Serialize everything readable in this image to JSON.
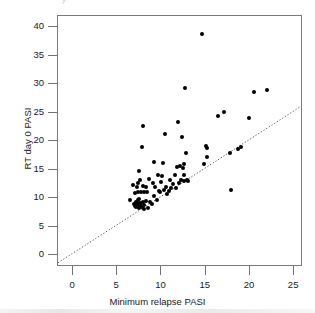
{
  "figure": {
    "scan_artifact_text": "y",
    "background_color": "#ffffff",
    "frame_color": "#777b7e",
    "point_color": "#000000",
    "reference_line_color": "#4d4d4d"
  },
  "chart_data": {
    "type": "scatter",
    "title": "",
    "xlabel": "Minimum relapse PASI",
    "ylabel": "RT day 0 PASI",
    "xlim": [
      -1.7,
      26.0
    ],
    "ylim": [
      -2.1,
      42.0
    ],
    "xticks": [
      0,
      5,
      10,
      15,
      20,
      25
    ],
    "yticks": [
      0,
      5,
      10,
      15,
      20,
      25,
      30,
      35,
      40
    ],
    "xticklabels": [
      "0",
      "5",
      "10",
      "15",
      "20",
      "25"
    ],
    "yticklabels": [
      "0",
      "5",
      "10",
      "15",
      "20",
      "25",
      "30",
      "35",
      "40"
    ],
    "grid": false,
    "legend": null,
    "marker": "filled-circle",
    "marker_size_px": 4,
    "annotations": [],
    "reference_line": {
      "label": "line of identity",
      "style": "dotted",
      "slope": 1.0,
      "intercept": 0.0,
      "x_start": -1.7,
      "x_end": 26.0,
      "y_start": -1.7,
      "y_end": 26.0
    },
    "points": [
      [
        6.4,
        9.6
      ],
      [
        6.8,
        12.3
      ],
      [
        6.9,
        9.0
      ],
      [
        7.0,
        8.7
      ],
      [
        7.0,
        10.9
      ],
      [
        7.1,
        9.3
      ],
      [
        7.1,
        8.4
      ],
      [
        7.2,
        11.9
      ],
      [
        7.2,
        9.1
      ],
      [
        7.25,
        8.6
      ],
      [
        7.3,
        12.6
      ],
      [
        7.3,
        9.6
      ],
      [
        7.35,
        8.9
      ],
      [
        7.4,
        11.0
      ],
      [
        7.4,
        9.4
      ],
      [
        7.45,
        8.3
      ],
      [
        7.5,
        14.7
      ],
      [
        7.5,
        9.8
      ],
      [
        7.55,
        9.0
      ],
      [
        7.6,
        13.1
      ],
      [
        7.6,
        8.6
      ],
      [
        7.7,
        11.1
      ],
      [
        7.7,
        9.2
      ],
      [
        7.8,
        19.0
      ],
      [
        7.8,
        8.5
      ],
      [
        7.9,
        22.6
      ],
      [
        7.9,
        12.2
      ],
      [
        7.95,
        9.4
      ],
      [
        8.0,
        11.0
      ],
      [
        8.0,
        8.8
      ],
      [
        8.05,
        8.1
      ],
      [
        8.2,
        12.0
      ],
      [
        8.3,
        9.5
      ],
      [
        8.4,
        11.0
      ],
      [
        8.5,
        8.2
      ],
      [
        8.6,
        13.4
      ],
      [
        8.7,
        9.3
      ],
      [
        8.9,
        9.0
      ],
      [
        9.0,
        12.7
      ],
      [
        9.1,
        10.3
      ],
      [
        9.2,
        16.4
      ],
      [
        9.3,
        11.9
      ],
      [
        9.5,
        9.6
      ],
      [
        9.6,
        14.1
      ],
      [
        9.7,
        11.3
      ],
      [
        9.8,
        11.0
      ],
      [
        10.0,
        12.9
      ],
      [
        10.1,
        13.9
      ],
      [
        10.2,
        16.2
      ],
      [
        10.3,
        11.5
      ],
      [
        10.4,
        21.3
      ],
      [
        10.5,
        12.0
      ],
      [
        10.6,
        10.8
      ],
      [
        10.8,
        11.2
      ],
      [
        11.0,
        13.1
      ],
      [
        11.1,
        11.8
      ],
      [
        11.3,
        12.4
      ],
      [
        11.5,
        14.0
      ],
      [
        11.6,
        11.7
      ],
      [
        11.8,
        15.4
      ],
      [
        11.9,
        23.4
      ],
      [
        12.0,
        12.6
      ],
      [
        12.1,
        15.7
      ],
      [
        12.2,
        13.2
      ],
      [
        12.3,
        20.7
      ],
      [
        12.4,
        15.3
      ],
      [
        12.5,
        16.0
      ],
      [
        12.5,
        14.0
      ],
      [
        12.6,
        13.0
      ],
      [
        12.7,
        29.3
      ],
      [
        12.8,
        17.9
      ],
      [
        12.9,
        13.1
      ],
      [
        13.0,
        13.0
      ],
      [
        14.6,
        38.8
      ],
      [
        14.8,
        16.0
      ],
      [
        15.0,
        19.2
      ],
      [
        15.1,
        18.8
      ],
      [
        15.2,
        17.3
      ],
      [
        16.4,
        24.4
      ],
      [
        17.1,
        25.2
      ],
      [
        17.7,
        17.9
      ],
      [
        17.9,
        11.5
      ],
      [
        18.6,
        18.7
      ],
      [
        19.0,
        18.9
      ],
      [
        19.9,
        24.1
      ],
      [
        20.5,
        28.6
      ],
      [
        21.9,
        29.0
      ]
    ]
  }
}
